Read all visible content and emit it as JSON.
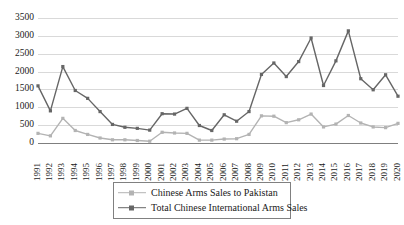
{
  "chart_data": {
    "type": "line",
    "title": "",
    "xlabel": "",
    "ylabel": "",
    "ylim": [
      0,
      3500
    ],
    "ytick_step": 500,
    "yticks": [
      "0",
      "500",
      "1000",
      "1500",
      "2000",
      "2500",
      "3000",
      "3500"
    ],
    "grid": true,
    "legend_position": "bottom",
    "categories": [
      "1991",
      "1992",
      "1993",
      "1994",
      "1995",
      "1996",
      "1997",
      "1998",
      "1999",
      "2000",
      "2001",
      "2002",
      "2003",
      "2004",
      "2005",
      "2006",
      "2007",
      "2008",
      "2009",
      "2010",
      "2011",
      "2012",
      "2013",
      "2014",
      "2015",
      "2016",
      "2017",
      "2018",
      "2019",
      "2020"
    ],
    "series": [
      {
        "name": "Chinese Arms Sales to Pakistan",
        "color": "#b3b3b3",
        "marker": "square",
        "values": [
          270,
          200,
          690,
          350,
          240,
          140,
          90,
          90,
          70,
          50,
          300,
          280,
          270,
          80,
          80,
          110,
          120,
          240,
          760,
          750,
          570,
          650,
          810,
          450,
          530,
          770,
          560,
          450,
          430,
          550
        ]
      },
      {
        "name": "Total Chinese International Arms Sales",
        "color": "#666666",
        "marker": "square",
        "values": [
          1600,
          900,
          2140,
          1470,
          1250,
          880,
          520,
          440,
          410,
          360,
          820,
          810,
          970,
          490,
          350,
          790,
          610,
          880,
          1920,
          2240,
          1860,
          2280,
          2940,
          1610,
          2300,
          3140,
          1800,
          1490,
          1910,
          1310
        ]
      }
    ]
  },
  "legend": {
    "items": [
      {
        "label": "Chinese Arms Sales to Pakistan"
      },
      {
        "label": "Total Chinese International Arms Sales"
      }
    ]
  }
}
